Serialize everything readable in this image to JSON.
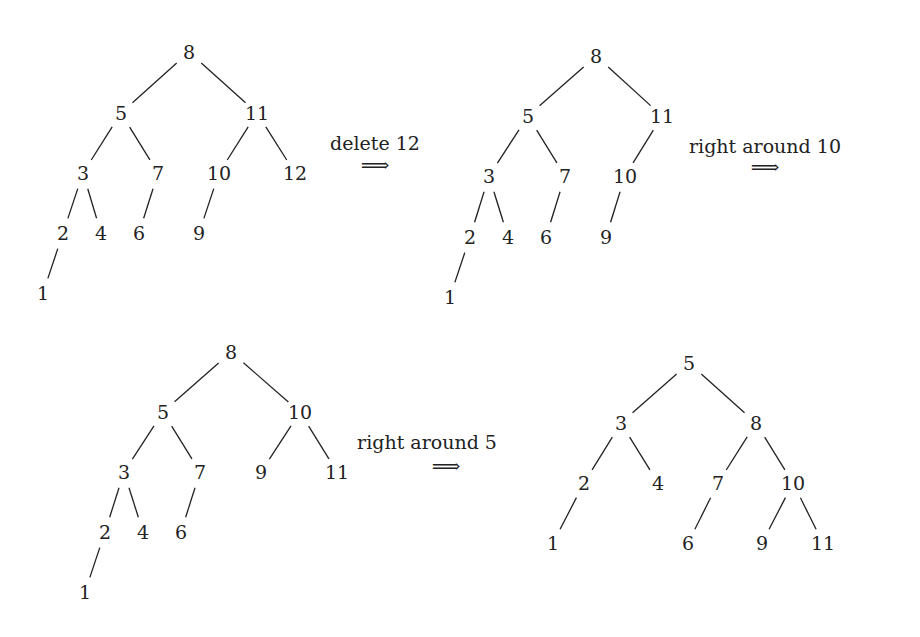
{
  "trees": [
    {
      "id": "tree-1",
      "nodes": [
        {
          "v": "8",
          "x": 189,
          "y": 52
        },
        {
          "v": "5",
          "x": 121,
          "y": 113
        },
        {
          "v": "11",
          "x": 257,
          "y": 113
        },
        {
          "v": "3",
          "x": 83,
          "y": 173
        },
        {
          "v": "7",
          "x": 158,
          "y": 173
        },
        {
          "v": "10",
          "x": 219,
          "y": 173
        },
        {
          "v": "12",
          "x": 295,
          "y": 173
        },
        {
          "v": "2",
          "x": 63,
          "y": 233
        },
        {
          "v": "4",
          "x": 101,
          "y": 233
        },
        {
          "v": "6",
          "x": 139,
          "y": 233
        },
        {
          "v": "9",
          "x": 199,
          "y": 233
        },
        {
          "v": "1",
          "x": 43,
          "y": 293
        }
      ],
      "edges": [
        [
          "8",
          "5"
        ],
        [
          "8",
          "11"
        ],
        [
          "5",
          "3"
        ],
        [
          "5",
          "7"
        ],
        [
          "11",
          "10"
        ],
        [
          "11",
          "12"
        ],
        [
          "3",
          "2"
        ],
        [
          "3",
          "4"
        ],
        [
          "7",
          "6"
        ],
        [
          "10",
          "9"
        ],
        [
          "2",
          "1"
        ]
      ]
    },
    {
      "id": "tree-2",
      "nodes": [
        {
          "v": "8",
          "x": 596,
          "y": 56
        },
        {
          "v": "5",
          "x": 528,
          "y": 116
        },
        {
          "v": "11",
          "x": 662,
          "y": 116
        },
        {
          "v": "3",
          "x": 489,
          "y": 176
        },
        {
          "v": "7",
          "x": 565,
          "y": 176
        },
        {
          "v": "10",
          "x": 625,
          "y": 176
        },
        {
          "v": "2",
          "x": 470,
          "y": 237
        },
        {
          "v": "4",
          "x": 508,
          "y": 237
        },
        {
          "v": "6",
          "x": 546,
          "y": 237
        },
        {
          "v": "9",
          "x": 606,
          "y": 237
        },
        {
          "v": "1",
          "x": 450,
          "y": 297
        }
      ],
      "edges": [
        [
          "8",
          "5"
        ],
        [
          "8",
          "11"
        ],
        [
          "5",
          "3"
        ],
        [
          "5",
          "7"
        ],
        [
          "11",
          "10"
        ],
        [
          "3",
          "2"
        ],
        [
          "3",
          "4"
        ],
        [
          "7",
          "6"
        ],
        [
          "10",
          "9"
        ],
        [
          "2",
          "1"
        ]
      ]
    },
    {
      "id": "tree-3",
      "nodes": [
        {
          "v": "8",
          "x": 231,
          "y": 352
        },
        {
          "v": "5",
          "x": 163,
          "y": 412
        },
        {
          "v": "10",
          "x": 300,
          "y": 412
        },
        {
          "v": "3",
          "x": 124,
          "y": 472
        },
        {
          "v": "7",
          "x": 200,
          "y": 472
        },
        {
          "v": "9",
          "x": 261,
          "y": 472
        },
        {
          "v": "11",
          "x": 337,
          "y": 472
        },
        {
          "v": "2",
          "x": 105,
          "y": 532
        },
        {
          "v": "4",
          "x": 143,
          "y": 532
        },
        {
          "v": "6",
          "x": 181,
          "y": 532
        },
        {
          "v": "1",
          "x": 85,
          "y": 592
        }
      ],
      "edges": [
        [
          "8",
          "5"
        ],
        [
          "8",
          "10"
        ],
        [
          "5",
          "3"
        ],
        [
          "5",
          "7"
        ],
        [
          "10",
          "9"
        ],
        [
          "10",
          "11"
        ],
        [
          "3",
          "2"
        ],
        [
          "3",
          "4"
        ],
        [
          "7",
          "6"
        ],
        [
          "2",
          "1"
        ]
      ]
    },
    {
      "id": "tree-4",
      "nodes": [
        {
          "v": "5",
          "x": 689,
          "y": 363
        },
        {
          "v": "3",
          "x": 621,
          "y": 423
        },
        {
          "v": "8",
          "x": 756,
          "y": 423
        },
        {
          "v": "2",
          "x": 584,
          "y": 483
        },
        {
          "v": "4",
          "x": 658,
          "y": 483
        },
        {
          "v": "7",
          "x": 718,
          "y": 483
        },
        {
          "v": "10",
          "x": 793,
          "y": 483
        },
        {
          "v": "1",
          "x": 553,
          "y": 543
        },
        {
          "v": "6",
          "x": 688,
          "y": 543
        },
        {
          "v": "9",
          "x": 762,
          "y": 543
        },
        {
          "v": "11",
          "x": 823,
          "y": 543
        }
      ],
      "edges": [
        [
          "5",
          "3"
        ],
        [
          "5",
          "8"
        ],
        [
          "3",
          "2"
        ],
        [
          "3",
          "4"
        ],
        [
          "8",
          "7"
        ],
        [
          "8",
          "10"
        ],
        [
          "2",
          "1"
        ],
        [
          "7",
          "6"
        ],
        [
          "10",
          "9"
        ],
        [
          "10",
          "11"
        ]
      ]
    }
  ],
  "transitions": [
    {
      "label": "delete 12",
      "x": 375,
      "y": 143,
      "arrow_x": 375,
      "arrow_y": 165,
      "arrow": "⟹"
    },
    {
      "label": "right around 10",
      "x": 765,
      "y": 146,
      "arrow_x": 765,
      "arrow_y": 167,
      "arrow": "⟹"
    },
    {
      "label": "right around 5",
      "x": 427,
      "y": 442,
      "arrow_x": 446,
      "arrow_y": 466,
      "arrow": "⟹"
    }
  ],
  "colors": {
    "ink": "#222222",
    "background": "#ffffff"
  }
}
